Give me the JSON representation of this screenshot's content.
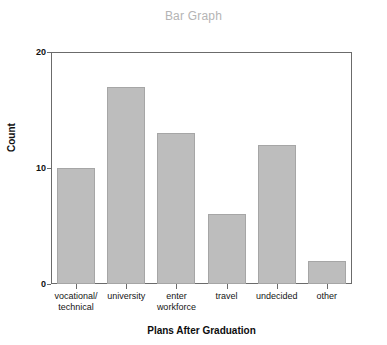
{
  "chart_data": {
    "type": "bar",
    "title": "Bar Graph",
    "xlabel": "Plans After Graduation",
    "ylabel": "Count",
    "categories": [
      "vocational/\ntechnical",
      "university",
      "enter\nworkforce",
      "travel",
      "undecided",
      "other"
    ],
    "values": [
      10,
      17,
      13,
      6,
      12,
      2
    ],
    "ylim": [
      0,
      20
    ],
    "ytick_labels": [
      "0",
      "10",
      "20"
    ],
    "ytick_values": [
      0,
      10,
      20
    ],
    "grid": false,
    "legend": false,
    "colors": {
      "bar_fill": "#bdbdbd",
      "bar_border": "#a6a6a6",
      "axis": "#6b6b6b",
      "title": "#b4b4b4",
      "text": "#111111",
      "background": "#ffffff"
    }
  }
}
